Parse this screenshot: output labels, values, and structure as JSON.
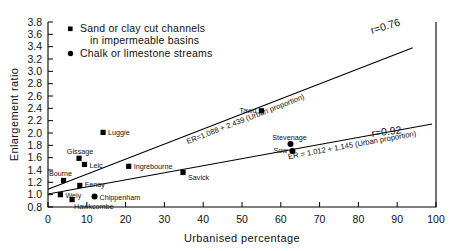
{
  "chart_data": {
    "type": "scatter",
    "title": "",
    "xlabel": "Urbanised percentage",
    "ylabel": "Enlargement ratio",
    "xlim": [
      0,
      100
    ],
    "ylim": [
      0.8,
      3.8
    ],
    "xticks": [
      "0",
      "10",
      "20",
      "30",
      "40",
      "50",
      "60",
      "70",
      "80",
      "90",
      "100"
    ],
    "yticks": [
      "0.8",
      "1.0",
      "1.2",
      "1.4",
      "1.6",
      "1.8",
      "2.0",
      "2.2",
      "2.4",
      "2.6",
      "2.8",
      "3.0",
      "3.2",
      "3.4",
      "3.6",
      "3.8"
    ],
    "grid": false,
    "legend_position": "top-left",
    "legend": [
      {
        "marker": "square",
        "label_line1": "Sand or clay cut channels",
        "label_line2": "in impermeable basins"
      },
      {
        "marker": "circle",
        "label_line1": "Chalk or limestone streams",
        "label_line2": ""
      }
    ],
    "series": [
      {
        "name": "Sand or clay cut channels in impermeable basins",
        "marker": "square",
        "points": [
          {
            "label": "Wely",
            "x": 3.2,
            "y": 1.0
          },
          {
            "label": "Hawkcombe",
            "x": 6.2,
            "y": 0.92
          },
          {
            "label": "Bourne",
            "x": 4.0,
            "y": 1.23
          },
          {
            "label": "Fenay",
            "x": 8.2,
            "y": 1.15
          },
          {
            "label": "Gissage",
            "x": 8.0,
            "y": 1.59
          },
          {
            "label": "Leic",
            "x": 9.4,
            "y": 1.49
          },
          {
            "label": "Luggie",
            "x": 14.2,
            "y": 2.01
          },
          {
            "label": "Ingrebourne",
            "x": 20.8,
            "y": 1.46
          },
          {
            "label": "Savick",
            "x": 34.8,
            "y": 1.36
          },
          {
            "label": "Tawd",
            "x": 55.0,
            "y": 2.36
          }
        ]
      },
      {
        "name": "Chalk or limestone streams",
        "marker": "circle",
        "points": [
          {
            "label": "Chippenham",
            "x": 12.0,
            "y": 0.97
          },
          {
            "label": "Stevenage",
            "x": 62.5,
            "y": 1.82
          },
          {
            "label": "Sow",
            "x": 63.0,
            "y": 1.71
          }
        ]
      }
    ],
    "fit_lines": [
      {
        "name": "upper-regression",
        "equation": "ER=1.088 + 2.439 (Urban proportion)",
        "r_label": "r=0.76",
        "intercept": 1.088,
        "slope_per_100_pct": 2.439,
        "x_start": 0,
        "x_end": 94
      },
      {
        "name": "lower-regression",
        "equation": "ER = 1.012 + 1.145 (Urban proportion)",
        "r_label": "r=0.92",
        "intercept": 1.012,
        "slope_per_100_pct": 1.145,
        "x_start": 0,
        "x_end": 99
      }
    ]
  }
}
